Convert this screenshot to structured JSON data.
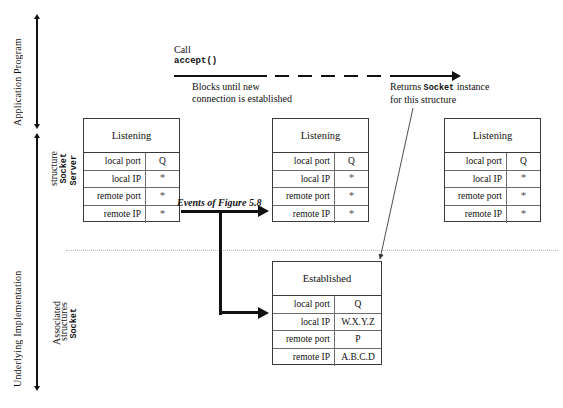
{
  "figure": {
    "left_axes": {
      "application_program": "Application Program",
      "underlying_implementation": "Underlying Implementation",
      "server_socket_structure_plain": "structure",
      "server_socket_structure_mono_a": "Server",
      "server_socket_structure_mono_b": "Socket",
      "associated_plain": "Associated",
      "associated_mono": "Socket",
      "associated_tail": "structures"
    },
    "call": {
      "line1": "Call",
      "line2": "accept()"
    },
    "blocks_note": {
      "line1": "Blocks until new",
      "line2": "connection is established"
    },
    "returns_note": {
      "prefix": "Returns ",
      "mono": "Socket",
      "suffix": " instance",
      "line2": "for this structure"
    },
    "events_label": "Events of Figure 5.8",
    "row_labels": {
      "local_port": "local port",
      "local_ip": "local IP",
      "remote_port": "remote port",
      "remote_ip": "remote IP"
    },
    "wildcard": "*",
    "sockets": [
      {
        "id": "listening-left",
        "title": "Listening",
        "rows": [
          {
            "key": "local port",
            "value": "Q"
          },
          {
            "key": "local IP",
            "value": "*"
          },
          {
            "key": "remote port",
            "value": "*"
          },
          {
            "key": "remote IP",
            "value": "*"
          }
        ]
      },
      {
        "id": "listening-middle",
        "title": "Listening",
        "rows": [
          {
            "key": "local port",
            "value": "Q"
          },
          {
            "key": "local IP",
            "value": "*"
          },
          {
            "key": "remote port",
            "value": "*"
          },
          {
            "key": "remote IP",
            "value": "*"
          }
        ]
      },
      {
        "id": "listening-right",
        "title": "Listening",
        "rows": [
          {
            "key": "local port",
            "value": "Q"
          },
          {
            "key": "local IP",
            "value": "*"
          },
          {
            "key": "remote port",
            "value": "*"
          },
          {
            "key": "remote IP",
            "value": "*"
          }
        ]
      },
      {
        "id": "established",
        "title": "Established",
        "rows": [
          {
            "key": "local port",
            "value": "Q"
          },
          {
            "key": "local IP",
            "value": "W.X.Y.Z"
          },
          {
            "key": "remote port",
            "value": "P"
          },
          {
            "key": "remote IP",
            "value": "A.B.C.D"
          }
        ]
      }
    ],
    "colors": {
      "ink": "#111111",
      "box_border": "#3a3a3a",
      "rule": "#6b6b6b",
      "dotted": "#b9b9b9",
      "background": "#ffffff"
    }
  }
}
